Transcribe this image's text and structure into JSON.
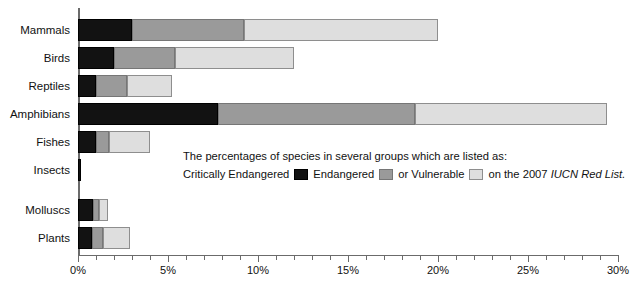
{
  "chart_data": {
    "type": "bar",
    "orientation": "horizontal",
    "stacked": true,
    "title": "",
    "xlabel": "",
    "ylabel": "",
    "xlim": [
      0,
      30
    ],
    "xunit": "%",
    "grid": false,
    "categories": [
      "Mammals",
      "Birds",
      "Reptiles",
      "Amphibians",
      "Fishes",
      "Insects",
      "Molluscs",
      "Plants"
    ],
    "tick_values": [
      0,
      1,
      2,
      3,
      4,
      5,
      6,
      7,
      8,
      9,
      10,
      11,
      12,
      13,
      14,
      15,
      16,
      17,
      18,
      19,
      20,
      21,
      22,
      23,
      24,
      25,
      26,
      27,
      28,
      29,
      30
    ],
    "tick_labels": [
      {
        "value": 0,
        "label": "0%"
      },
      {
        "value": 5,
        "label": "5%"
      },
      {
        "value": 10,
        "label": "10%"
      },
      {
        "value": 15,
        "label": "15%"
      },
      {
        "value": 20,
        "label": "20%"
      },
      {
        "value": 25,
        "label": "25%"
      },
      {
        "value": 30,
        "label": "30%"
      }
    ],
    "series": [
      {
        "name": "Critically Endangered",
        "color": "#121212",
        "values": [
          3.0,
          2.0,
          1.0,
          7.8,
          1.0,
          0.15,
          0.85,
          0.8
        ]
      },
      {
        "name": "Endangered",
        "color": "#9a9a9a",
        "values": [
          6.2,
          3.4,
          1.7,
          10.9,
          0.7,
          0.0,
          0.3,
          0.6
        ]
      },
      {
        "name": "Vulnerable",
        "color": "#dedede",
        "values": [
          10.8,
          6.6,
          2.5,
          10.7,
          2.3,
          0.0,
          0.5,
          1.5
        ]
      }
    ],
    "totals": [
      20.0,
      12.0,
      5.2,
      29.4,
      4.0,
      0.15,
      1.65,
      2.9
    ],
    "legend_position": "inside-center-right"
  },
  "legend": {
    "line1": "The percentages of species in several groups which are listed as:",
    "label_cr": "Critically Endangered",
    "label_en": "Endangered",
    "label_or": "or Vulnerable",
    "label_tail_prefix": "on the 2007 ",
    "label_tail_italic": "IUCN Red List."
  }
}
